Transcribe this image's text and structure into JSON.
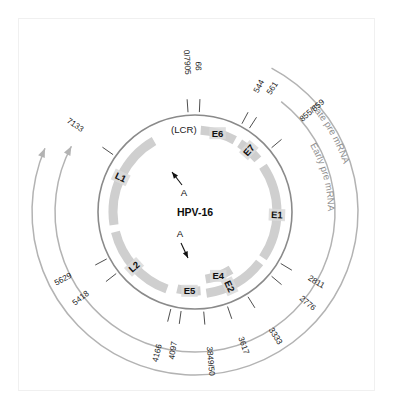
{
  "figure": {
    "center_label": "HPV-16",
    "lcr_label": "(LCR)",
    "polyA_label_top": "A",
    "polyA_label_bottom": "A"
  },
  "colors": {
    "genome_circle": "#8a8a8a",
    "gene_arc": "#cfcfcf",
    "mrna_arc": "#b3b3b3",
    "tick_line": "#3a3a3a",
    "text": "#111111",
    "mrna_text": "#8f8f8f",
    "frame": "#f0f0f0",
    "label_box": "#d9d9d9"
  },
  "geometry": {
    "center_x": 195,
    "center_y": 212,
    "genome_radius": 97,
    "gene_arc_radius": 82,
    "gene_arc_width": 9,
    "early_mrna_radius": 140,
    "late_mrna_radius": 163
  },
  "genes": [
    {
      "name": "E6",
      "start_deg": 4,
      "end_deg": 29,
      "label_deg": 16,
      "label_r": 82,
      "rotate": false
    },
    {
      "name": "E7",
      "start_deg": 33,
      "end_deg": 50,
      "label_deg": 41,
      "label_r": 82,
      "rotate": true
    },
    {
      "name": "E1",
      "start_deg": 56,
      "end_deg": 124,
      "label_deg": 92,
      "label_r": 82,
      "rotate": true
    },
    {
      "name": "E2",
      "start_deg": 128,
      "end_deg": 172,
      "label_deg": 155,
      "label_r": 82,
      "rotate": true
    },
    {
      "name": "E4",
      "start_deg": 148,
      "end_deg": 171,
      "label_deg": 160,
      "label_r": 68,
      "rotate": false
    },
    {
      "name": "E5",
      "start_deg": 176,
      "end_deg": 193,
      "label_deg": 184,
      "label_r": 79,
      "rotate": false
    },
    {
      "name": "L2",
      "start_deg": 200,
      "end_deg": 256,
      "label_deg": 228,
      "label_r": 82,
      "rotate": true
    },
    {
      "name": "L1",
      "start_deg": 261,
      "end_deg": 330,
      "label_deg": 295,
      "label_r": 82,
      "rotate": true
    }
  ],
  "ticks": [
    {
      "label": "0/7905",
      "angle_deg": 356.0,
      "label_r": 150
    },
    {
      "label": "99",
      "angle_deg": 2.5,
      "label_r": 146
    },
    {
      "label": "544",
      "angle_deg": 28.0,
      "label_r": 141
    },
    {
      "label": "561",
      "angle_deg": 33.0,
      "label_r": 146
    },
    {
      "label": "855/859",
      "angle_deg": 50.0,
      "label_r": 155
    },
    {
      "label": "2811",
      "angle_deg": 121.0,
      "label_r": 140
    },
    {
      "label": "2776",
      "angle_deg": 130.0,
      "label_r": 145
    },
    {
      "label": "3333",
      "angle_deg": 148.0,
      "label_r": 148
    },
    {
      "label": "3617",
      "angle_deg": 161.0,
      "label_r": 142
    },
    {
      "label": "3849/50",
      "angle_deg": 175.0,
      "label_r": 150
    },
    {
      "label": "4097",
      "angle_deg": 188.0,
      "label_r": 140
    },
    {
      "label": "4166",
      "angle_deg": 194.0,
      "label_r": 146
    },
    {
      "label": "5418",
      "angle_deg": 232.0,
      "label_r": 143
    },
    {
      "label": "5629",
      "angle_deg": 242.0,
      "label_r": 148
    },
    {
      "label": "7133",
      "angle_deg": 305.0,
      "label_r": 148
    }
  ],
  "mrna": [
    {
      "id": "early",
      "label": "Early pre mRNA",
      "radius": 140,
      "start_deg": 38,
      "end_deg": 298,
      "label_deg": 60,
      "arrow": "counterclockwise-end"
    },
    {
      "id": "late",
      "label": "Late pre mRNA",
      "radius": 163,
      "start_deg": 28,
      "end_deg": 293,
      "label_deg": 48,
      "arrow": "counterclockwise-end"
    }
  ],
  "polyA_arrows": [
    {
      "id": "early-polyA",
      "label": "A",
      "tip_x": 172,
      "tip_y": 172,
      "tail_x": 182,
      "tail_y": 185,
      "text_x": 184,
      "text_y": 196
    },
    {
      "id": "late-polyA",
      "label": "A",
      "tip_x": 188,
      "tip_y": 258,
      "tail_x": 181,
      "tail_y": 243,
      "text_x": 180,
      "text_y": 237
    }
  ]
}
